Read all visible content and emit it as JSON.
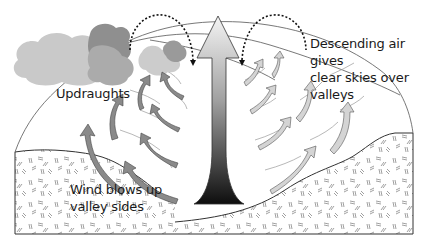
{
  "diagram": {
    "labels": {
      "updraughts": "Updraughts",
      "descending_line1": "Descending air gives",
      "descending_line2": "clear skies over valleys",
      "wind_line1": "Wind blows up",
      "wind_line2": "valley sides"
    },
    "elements": {
      "clouds": [
        "large-cloud-left",
        "small-cloud-center"
      ],
      "central_arrow": "rising-air-arrow",
      "descending_arrows": [
        "dotted-arc-left",
        "dotted-arc-right"
      ],
      "side_arrows_left": 7,
      "side_arrows_right": 7
    },
    "colors": {
      "cloud_light": "#c9c9c9",
      "cloud_mid": "#aaaaaa",
      "cloud_dark": "#8f8f8f",
      "arrow_fill": "#8a8a8a",
      "arrow_light": "#d2d2d2",
      "central_gradient_top": "#f2f2f2",
      "central_gradient_bottom": "#111111",
      "line": "#333333"
    }
  }
}
